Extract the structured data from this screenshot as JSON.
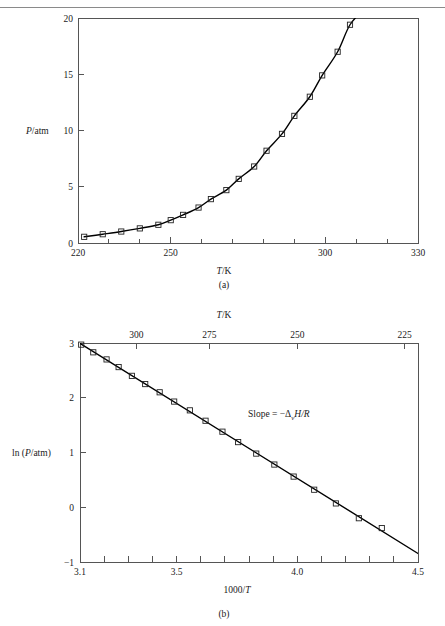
{
  "figure": {
    "panel_a_caption": "(a)",
    "panel_b_caption": "(b)"
  },
  "panel_a": {
    "xlabel": "T/K",
    "xlabel_italic": "T",
    "xlabel_rest": "/K",
    "ylabel_italic": "P",
    "ylabel_rest": "/atm",
    "xticks": [
      "220",
      "250",
      "300",
      "330"
    ],
    "yticks": [
      "0",
      "5",
      "10",
      "15",
      "20"
    ]
  },
  "panel_b": {
    "xlabel_italic": "1000/",
    "xlabel_italic2": "T",
    "top_axis_italic": "T",
    "top_axis_rest": "/K",
    "ylabel_pre": "ln (",
    "ylabel_italic": "P",
    "ylabel_post": "/atm)",
    "xticks": [
      "3.1",
      "3.5",
      "4.0",
      "4.5"
    ],
    "yticks": [
      "−1",
      "0",
      "1",
      "2",
      "3"
    ],
    "top_ticks": [
      "300",
      "275",
      "250",
      "225"
    ],
    "annotation": {
      "text_pre": "Slope  =  −Δ",
      "subscript": "v",
      "text_post": "H/R"
    }
  },
  "colors": {
    "axis": "#555555",
    "curve": "#000000",
    "marker_stroke": "#222222",
    "text": "#1a1a1a",
    "rule": "#8a8a8a",
    "background": "#ffffff"
  },
  "chart_data": [
    {
      "type": "line",
      "id": "panel-a",
      "title": "",
      "xlabel": "T/K",
      "ylabel": "P/atm",
      "xlim": [
        220,
        330
      ],
      "ylim": [
        0,
        20
      ],
      "xticks": [
        220,
        250,
        300,
        330
      ],
      "xminorticks": [
        230,
        240,
        260,
        270,
        280,
        290,
        310,
        320
      ],
      "yticks": [
        0,
        5,
        10,
        15,
        20
      ],
      "grid": false,
      "legend": null,
      "marker": "open-square",
      "x": [
        222,
        228,
        234,
        240,
        246,
        250,
        254,
        259,
        263,
        268,
        272,
        277,
        281,
        286,
        290,
        295,
        299,
        304,
        308,
        313,
        317
      ],
      "y": [
        0.55,
        0.78,
        1.02,
        1.3,
        1.62,
        2.03,
        2.5,
        3.15,
        3.9,
        4.7,
        5.7,
        6.8,
        8.2,
        9.7,
        11.3,
        13.0,
        14.9,
        17.0,
        19.4,
        21.0,
        23.0
      ],
      "series": [
        {
          "name": "vapor pressure",
          "x": [
            222,
            228,
            234,
            240,
            246,
            250,
            254,
            259,
            263,
            268,
            272,
            277,
            281,
            286,
            290,
            295,
            299,
            304,
            308
          ],
          "values": [
            0.55,
            0.78,
            1.02,
            1.3,
            1.62,
            2.03,
            2.5,
            3.15,
            3.9,
            4.7,
            5.7,
            6.8,
            8.2,
            9.7,
            11.3,
            13.0,
            14.9,
            17.0,
            19.4
          ]
        }
      ]
    },
    {
      "type": "line",
      "id": "panel-b",
      "title": "",
      "xlabel": "1000/T",
      "ylabel": "ln (P/atm)",
      "top_axis_label": "T/K",
      "xlim": [
        3.1,
        4.5
      ],
      "ylim": [
        -1,
        3
      ],
      "xticks": [
        3.1,
        3.5,
        4.0,
        4.5
      ],
      "xminorticks": [
        3.2,
        3.3,
        3.4,
        3.6,
        3.7,
        3.8,
        3.9,
        4.1,
        4.2,
        4.3,
        4.4
      ],
      "yticks": [
        -1,
        0,
        1,
        2,
        3
      ],
      "top_ticks_values": [
        300,
        275,
        250,
        225
      ],
      "top_ticks_positions": [
        3.333,
        3.636,
        4.0,
        4.444
      ],
      "grid": false,
      "legend": null,
      "marker": "open-square",
      "annotation": "Slope = −ΔvH/R",
      "x": [
        3.105,
        3.155,
        3.21,
        3.26,
        3.315,
        3.37,
        3.43,
        3.49,
        3.555,
        3.62,
        3.69,
        3.755,
        3.83,
        3.905,
        3.985,
        4.07,
        4.16,
        4.255,
        4.35,
        4.43
      ],
      "y": [
        2.97,
        2.83,
        2.7,
        2.56,
        2.4,
        2.25,
        2.1,
        1.93,
        1.77,
        1.58,
        1.38,
        1.19,
        0.98,
        0.78,
        0.56,
        0.32,
        0.07,
        -0.2,
        -0.38,
        -0.47
      ],
      "series": [
        {
          "name": "ln P vs 1000/T",
          "x": [
            3.105,
            3.155,
            3.21,
            3.26,
            3.315,
            3.37,
            3.43,
            3.49,
            3.555,
            3.62,
            3.69,
            3.755,
            3.83,
            3.905,
            3.985,
            4.07,
            4.16,
            4.255,
            4.35
          ],
          "values": [
            2.97,
            2.83,
            2.7,
            2.56,
            2.4,
            2.25,
            2.1,
            1.93,
            1.77,
            1.58,
            1.38,
            1.19,
            0.98,
            0.78,
            0.56,
            0.32,
            0.07,
            -0.2,
            -0.38
          ]
        }
      ]
    }
  ]
}
